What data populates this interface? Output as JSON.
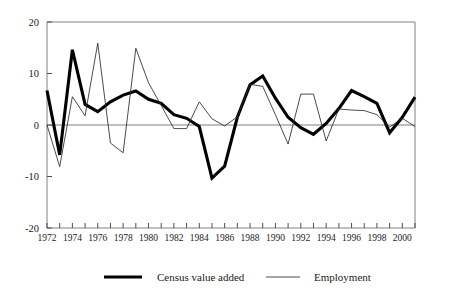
{
  "chart_data": {
    "type": "line",
    "title": "",
    "xlabel": "",
    "ylabel": "",
    "xlim": [
      1972,
      2001
    ],
    "ylim": [
      -20,
      20
    ],
    "yticks": [
      20,
      10,
      0,
      -10,
      -20
    ],
    "ytick_labels": [
      "20",
      "10",
      "0",
      "-10",
      "-20"
    ],
    "x": [
      1972,
      1973,
      1974,
      1975,
      1976,
      1977,
      1978,
      1979,
      1980,
      1981,
      1982,
      1983,
      1984,
      1985,
      1986,
      1987,
      1988,
      1989,
      1990,
      1991,
      1992,
      1993,
      1994,
      1995,
      1996,
      1997,
      1998,
      1999,
      2000,
      2001
    ],
    "xtick_labels": [
      "1972",
      "1974",
      "1976",
      "1978",
      "1980",
      "1982",
      "1984",
      "1986",
      "1988",
      "1990",
      "1992",
      "1994",
      "1996",
      "1998",
      "2000"
    ],
    "xtick_values": [
      1972,
      1974,
      1976,
      1978,
      1980,
      1982,
      1984,
      1986,
      1988,
      1990,
      1992,
      1994,
      1996,
      1998,
      2000
    ],
    "grid": false,
    "legend_position": "bottom",
    "series": [
      {
        "name": "Census value added",
        "style": "thick",
        "color": "#000000",
        "values": [
          6.7,
          -5.8,
          14.6,
          4.0,
          2.6,
          4.5,
          5.8,
          6.6,
          5.0,
          4.2,
          2.0,
          1.3,
          -0.3,
          -10.3,
          -8.0,
          1.5,
          7.8,
          9.5,
          5.2,
          1.5,
          -0.5,
          -1.8,
          0.3,
          3.2,
          6.7,
          5.5,
          4.2,
          -1.5,
          1.5,
          5.4
        ]
      },
      {
        "name": "Employment",
        "style": "thin",
        "color": "#2b2b2b",
        "values": [
          0.0,
          -8.1,
          5.5,
          1.8,
          15.9,
          -3.5,
          -5.4,
          14.9,
          8.2,
          3.8,
          -0.7,
          -0.7,
          4.5,
          1.2,
          -0.2,
          1.6,
          7.9,
          7.5,
          2.0,
          -3.7,
          6.0,
          6.0,
          -3.1,
          3.1,
          2.9,
          2.8,
          2.0,
          -0.4,
          1.3,
          -0.3
        ]
      }
    ]
  },
  "legend": {
    "entries": [
      {
        "label": "Census value added",
        "style": "thick"
      },
      {
        "label": "Employment",
        "style": "thin"
      }
    ]
  }
}
